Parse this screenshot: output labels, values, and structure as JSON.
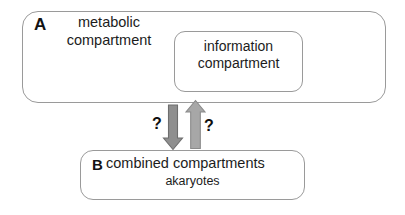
{
  "figure": {
    "background_color": "#ffffff",
    "box_stroke_color": "#9a9a9a",
    "text_color": "#1c1c1c"
  },
  "panel_a": {
    "letter": "A",
    "outer_label_line1": "metabolic",
    "outer_label_line2": "compartment",
    "inner_box": {
      "label_line1": "information",
      "label_line2": "compartment"
    }
  },
  "panel_b": {
    "letter": "B",
    "label_line1": "combined compartments",
    "label_line2": "akaryotes"
  },
  "arrows": {
    "down": {
      "direction": "down",
      "fill_color": "#8f8f8f",
      "stroke_color": "#6e6e6e",
      "question_mark": "?"
    },
    "up": {
      "direction": "up",
      "fill_color": "#a7a7a7",
      "stroke_color": "#8a8a8a",
      "question_mark": "?"
    }
  }
}
